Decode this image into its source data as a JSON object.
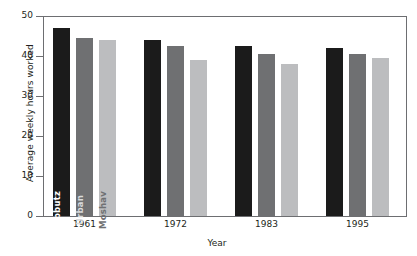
{
  "chart_data": {
    "type": "bar",
    "title": "",
    "xlabel": "Year",
    "ylabel": "Average weekly hours worked",
    "categories": [
      "1961",
      "1972",
      "1983",
      "1995"
    ],
    "ylim": [
      0,
      50
    ],
    "yticks": [
      0,
      10,
      20,
      30,
      40,
      50
    ],
    "ytick_labels": [
      "0",
      "10",
      "20",
      "30",
      "40",
      "50"
    ],
    "grid": false,
    "legend_position": "in-bar-labels",
    "series": [
      {
        "name": "Kibbutz",
        "color": "#1b1b1b",
        "values": [
          47,
          44,
          42.5,
          42
        ]
      },
      {
        "name": "Urban",
        "color": "#6f7072",
        "values": [
          44.5,
          42.5,
          40.5,
          40.5
        ]
      },
      {
        "name": "Moshav",
        "color": "#bcbdbf",
        "values": [
          44,
          39,
          38,
          39.5
        ]
      }
    ]
  }
}
